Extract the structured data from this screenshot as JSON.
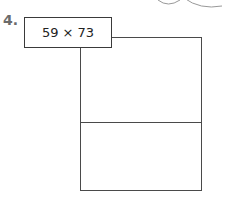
{
  "problem": {
    "number": "4.",
    "expression": "59 × 73"
  },
  "area_model": {
    "rows": 2,
    "columns": 1
  }
}
